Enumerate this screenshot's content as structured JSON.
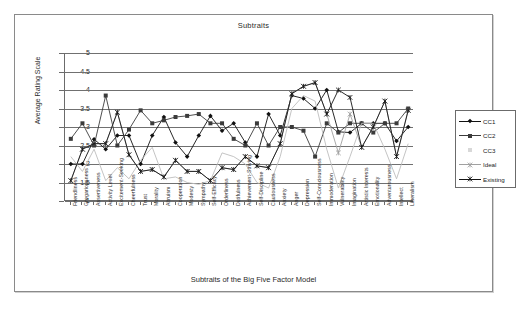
{
  "chart_data": {
    "type": "line",
    "title": "Subtraits",
    "xlabel": "Subtraits of the Big Five Factor Model",
    "ylabel": "Average Rating Scale",
    "ylim": [
      1,
      5
    ],
    "ytick_labels": [
      "5",
      "4.5",
      "4",
      "3.5",
      "3",
      "2.5",
      "2",
      "1.5",
      "1"
    ],
    "grid": true,
    "legend_position": "right",
    "categories": [
      "Friendliness",
      "Gregariousness",
      "Assertiveness",
      "Activity Level",
      "Excitement-Seeking",
      "Cheerfulness",
      "Trust",
      "Morality",
      "Altruism",
      "Cooperation",
      "Modesty",
      "Sympathy",
      "Self-Efficacy",
      "Orderliness",
      "Dutifulness",
      "Achievement-Striving",
      "Self-Discipline",
      "Cautiousness",
      "Anxiety",
      "Anger",
      "Depression",
      "Self-Consciousness",
      "Immoderation",
      "Vulnerability",
      "Imagination",
      "Artistic Interests",
      "Emotionality",
      "Adventurousness",
      "Intellect",
      "Liberalism"
    ],
    "series": [
      {
        "name": "CC1",
        "marker": "diamond",
        "color": "#111111",
        "values": [
          2.0,
          2.0,
          2.67,
          2.4,
          2.77,
          2.77,
          2.0,
          2.77,
          3.27,
          2.58,
          2.2,
          2.77,
          3.3,
          2.9,
          3.1,
          2.58,
          2.2,
          3.35,
          2.77,
          3.85,
          3.77,
          3.5,
          4.0,
          2.87,
          2.85,
          3.1,
          3.1,
          3.1,
          2.62,
          3.0
        ]
      },
      {
        "name": "CC2",
        "marker": "square",
        "color": "#3b3b3b",
        "values": [
          2.68,
          3.1,
          2.5,
          3.85,
          2.5,
          2.93,
          3.45,
          3.1,
          3.18,
          3.27,
          3.3,
          3.35,
          3.1,
          3.1,
          2.68,
          2.5,
          3.1,
          2.5,
          3.0,
          3.0,
          2.9,
          2.2,
          3.1,
          2.85,
          3.1,
          3.1,
          2.85,
          3.1,
          3.1,
          3.5
        ]
      },
      {
        "name": "CC3",
        "marker": "none",
        "color": "#bdbdbd",
        "values": [
          2.2,
          1.8,
          2.4,
          1.55,
          1.9,
          1.6,
          2.1,
          2.45,
          1.6,
          1.65,
          1.5,
          1.45,
          1.55,
          2.3,
          2.2,
          2.0,
          1.5,
          1.35,
          2.2,
          3.5,
          3.85,
          3.7,
          2.4,
          1.35,
          2.2,
          3.1,
          3.1,
          2.4,
          1.6,
          2.55
        ]
      },
      {
        "name": "Ideal",
        "marker": "star",
        "color": "#a0a0a0",
        "values": [
          1.55,
          2.4,
          2.55,
          2.55,
          3.4,
          2.25,
          1.8,
          1.85,
          1.65,
          2.1,
          1.8,
          1.8,
          1.55,
          1.9,
          1.85,
          2.2,
          1.95,
          1.9,
          2.55,
          3.9,
          4.1,
          4.2,
          3.35,
          2.3,
          3.35,
          2.45,
          3.0,
          3.7,
          2.2,
          3.45
        ]
      },
      {
        "name": "Existing",
        "marker": "star",
        "color": "#141414",
        "values": [
          1.55,
          2.4,
          2.55,
          2.55,
          3.4,
          2.25,
          1.8,
          1.85,
          1.65,
          2.1,
          1.8,
          1.8,
          1.55,
          1.9,
          1.85,
          2.2,
          1.95,
          1.9,
          2.55,
          3.9,
          4.1,
          4.2,
          3.35,
          4.0,
          3.8,
          2.45,
          3.0,
          3.7,
          2.2,
          3.45
        ]
      }
    ]
  },
  "legend": {
    "items": [
      {
        "label": "CC1"
      },
      {
        "label": "CC2"
      },
      {
        "label": "CC3"
      },
      {
        "label": "Ideal"
      },
      {
        "label": "Existing"
      }
    ]
  }
}
